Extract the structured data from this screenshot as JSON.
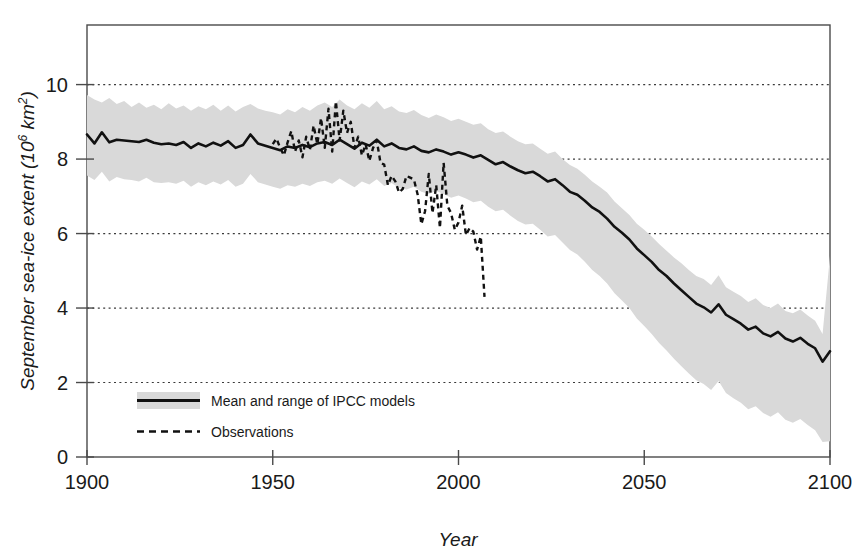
{
  "chart_data": {
    "type": "line",
    "title": "",
    "xlabel": "Year",
    "ylabel_parts": {
      "main": "September sea-ice extent (10",
      "superscript": "6",
      "tail": " km²)"
    },
    "ylabel": "September sea-ice extent (10⁶ km²)",
    "xlim": [
      1900,
      2100
    ],
    "ylim": [
      0,
      11.6
    ],
    "xticks": [
      1900,
      1950,
      2000,
      2050,
      2100
    ],
    "yticks": [
      0,
      2,
      4,
      6,
      8,
      10
    ],
    "grid": "horizontal-dotted",
    "legend_position": "inside-bottom-left",
    "colors": {
      "band": "#d9d9d9",
      "mean_line": "#111111",
      "observations": "#111111",
      "axis": "#4a4a4a",
      "gridline": "#3a3a3a",
      "background": "#ffffff"
    },
    "legend": [
      {
        "label": "Mean and range of IPCC models",
        "marker": "band-with-solid-line"
      },
      {
        "label": "Observations",
        "marker": "dashed-line"
      }
    ],
    "series": [
      {
        "name": "Mean and range of IPCC models",
        "style": "solid",
        "x": [
          1900,
          1902,
          1904,
          1906,
          1908,
          1910,
          1912,
          1914,
          1916,
          1918,
          1920,
          1922,
          1924,
          1926,
          1928,
          1930,
          1932,
          1934,
          1936,
          1938,
          1940,
          1942,
          1944,
          1946,
          1948,
          1950,
          1952,
          1954,
          1956,
          1958,
          1960,
          1962,
          1964,
          1966,
          1968,
          1970,
          1972,
          1974,
          1976,
          1978,
          1980,
          1982,
          1984,
          1986,
          1988,
          1990,
          1992,
          1994,
          1996,
          1998,
          2000,
          2002,
          2004,
          2006,
          2008,
          2010,
          2012,
          2014,
          2016,
          2018,
          2020,
          2022,
          2024,
          2026,
          2028,
          2030,
          2032,
          2034,
          2036,
          2038,
          2040,
          2042,
          2044,
          2046,
          2048,
          2050,
          2052,
          2054,
          2056,
          2058,
          2060,
          2062,
          2064,
          2066,
          2068,
          2070,
          2072,
          2074,
          2076,
          2078,
          2080,
          2082,
          2084,
          2086,
          2088,
          2090,
          2092,
          2094,
          2096,
          2098,
          2100
        ],
        "values": [
          8.66,
          8.42,
          8.72,
          8.45,
          8.52,
          8.5,
          8.48,
          8.46,
          8.52,
          8.44,
          8.4,
          8.42,
          8.38,
          8.46,
          8.3,
          8.42,
          8.34,
          8.44,
          8.36,
          8.48,
          8.3,
          8.38,
          8.66,
          8.42,
          8.36,
          8.3,
          8.24,
          8.34,
          8.3,
          8.38,
          8.32,
          8.42,
          8.46,
          8.38,
          8.52,
          8.4,
          8.28,
          8.44,
          8.36,
          8.52,
          8.34,
          8.42,
          8.3,
          8.26,
          8.34,
          8.22,
          8.18,
          8.26,
          8.2,
          8.12,
          8.18,
          8.12,
          8.04,
          8.1,
          7.98,
          7.86,
          7.92,
          7.8,
          7.7,
          7.62,
          7.66,
          7.54,
          7.4,
          7.46,
          7.3,
          7.12,
          7.04,
          6.88,
          6.7,
          6.58,
          6.4,
          6.18,
          6.02,
          5.84,
          5.6,
          5.42,
          5.24,
          5.02,
          4.86,
          4.66,
          4.48,
          4.3,
          4.12,
          4.02,
          3.88,
          4.1,
          3.82,
          3.7,
          3.58,
          3.42,
          3.5,
          3.32,
          3.24,
          3.36,
          3.18,
          3.1,
          3.2,
          3.04,
          2.92,
          2.56,
          2.84
        ]
      },
      {
        "name": "IPCC model range upper bound",
        "style": "band-upper",
        "values": [
          9.72,
          9.6,
          9.52,
          9.64,
          9.48,
          9.56,
          9.4,
          9.52,
          9.38,
          9.46,
          9.34,
          9.5,
          9.36,
          9.44,
          9.3,
          9.42,
          9.34,
          9.46,
          9.3,
          9.44,
          9.28,
          9.4,
          9.48,
          9.36,
          9.3,
          9.26,
          9.2,
          9.34,
          9.26,
          9.4,
          9.3,
          9.44,
          9.52,
          9.4,
          9.6,
          9.44,
          9.34,
          9.5,
          9.38,
          9.56,
          9.34,
          9.42,
          9.28,
          9.24,
          9.32,
          9.18,
          9.1,
          9.2,
          9.12,
          9.02,
          9.08,
          9.0,
          8.92,
          8.96,
          8.8,
          8.7,
          8.74,
          8.6,
          8.48,
          8.4,
          8.42,
          8.28,
          8.14,
          8.2,
          8.0,
          7.84,
          7.74,
          7.58,
          7.4,
          7.26,
          7.1,
          6.86,
          6.68,
          6.5,
          6.26,
          6.1,
          5.92,
          5.72,
          5.54,
          5.36,
          5.2,
          5.02,
          4.86,
          4.78,
          4.62,
          4.88,
          4.56,
          4.44,
          4.32,
          4.16,
          4.26,
          4.08,
          4.0,
          4.12,
          3.92,
          3.86,
          3.96,
          3.8,
          3.66,
          3.3,
          5.4
        ]
      },
      {
        "name": "IPCC model range lower bound",
        "style": "band-lower",
        "values": [
          7.56,
          7.44,
          7.66,
          7.4,
          7.52,
          7.46,
          7.44,
          7.4,
          7.5,
          7.38,
          7.36,
          7.38,
          7.34,
          7.42,
          7.26,
          7.38,
          7.3,
          7.4,
          7.32,
          7.44,
          7.26,
          7.34,
          7.6,
          7.38,
          7.32,
          7.26,
          7.2,
          7.3,
          7.26,
          7.34,
          7.28,
          7.38,
          7.42,
          7.34,
          7.48,
          7.36,
          7.24,
          7.4,
          7.32,
          7.46,
          7.28,
          7.36,
          7.22,
          7.18,
          7.26,
          7.12,
          7.06,
          7.14,
          7.06,
          6.96,
          7.02,
          6.94,
          6.84,
          6.88,
          6.72,
          6.6,
          6.64,
          6.48,
          6.34,
          6.24,
          6.26,
          6.1,
          5.92,
          5.96,
          5.76,
          5.56,
          5.44,
          5.24,
          5.02,
          4.86,
          4.66,
          4.4,
          4.2,
          4.0,
          3.72,
          3.52,
          3.3,
          3.06,
          2.86,
          2.64,
          2.44,
          2.24,
          2.06,
          1.96,
          1.8,
          2.04,
          1.72,
          1.58,
          1.46,
          1.28,
          1.36,
          1.18,
          1.08,
          1.2,
          1.0,
          0.92,
          1.02,
          0.86,
          0.72,
          0.4,
          0.42
        ]
      },
      {
        "name": "Observations",
        "style": "dashed",
        "x": [
          1950,
          1951,
          1952,
          1953,
          1954,
          1955,
          1956,
          1957,
          1958,
          1959,
          1960,
          1961,
          1962,
          1963,
          1964,
          1965,
          1966,
          1967,
          1968,
          1969,
          1970,
          1971,
          1972,
          1973,
          1974,
          1975,
          1976,
          1977,
          1978,
          1979,
          1980,
          1981,
          1982,
          1983,
          1984,
          1985,
          1986,
          1987,
          1988,
          1989,
          1990,
          1991,
          1992,
          1993,
          1994,
          1995,
          1996,
          1997,
          1998,
          1999,
          2000,
          2001,
          2002,
          2003,
          2004,
          2005,
          2006,
          2007
        ],
        "values": [
          8.4,
          8.55,
          8.3,
          8.1,
          8.45,
          8.75,
          8.2,
          8.5,
          8.05,
          8.6,
          8.25,
          8.9,
          8.4,
          9.1,
          8.3,
          9.35,
          8.2,
          9.55,
          8.5,
          9.3,
          8.7,
          9.0,
          8.3,
          8.6,
          8.1,
          8.4,
          7.95,
          8.3,
          8.5,
          7.9,
          7.85,
          7.3,
          7.55,
          7.4,
          7.1,
          7.2,
          7.55,
          7.5,
          7.45,
          7.05,
          6.25,
          6.6,
          7.6,
          6.55,
          7.3,
          6.15,
          7.9,
          6.75,
          6.55,
          6.1,
          6.3,
          6.75,
          5.96,
          6.15,
          6.05,
          5.57,
          5.92,
          4.3
        ]
      }
    ]
  },
  "axis": {
    "x_tick_labels": [
      "1900",
      "1950",
      "2000",
      "2050",
      "2100"
    ],
    "y_tick_labels": [
      "0",
      "2",
      "4",
      "6",
      "8",
      "10"
    ],
    "x_title": "Year",
    "y_title_main": "September sea-ice extent (10",
    "y_title_sup": "6",
    "y_title_tail": " km",
    "y_title_sup2": "2",
    "y_title_end": ")"
  },
  "legend": {
    "items": [
      {
        "label": "Mean and range of IPCC models",
        "marker": "band-with-solid-line"
      },
      {
        "label": "Observations",
        "marker": "dashed-line"
      }
    ]
  }
}
